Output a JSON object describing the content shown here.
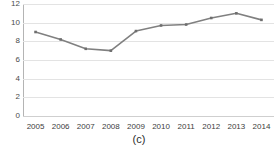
{
  "figure": {
    "caption": "(c)",
    "title_clipped": ""
  },
  "chart_data": {
    "type": "line",
    "title": "",
    "xlabel": "",
    "ylabel": "",
    "categories": [
      "2005",
      "2006",
      "2007",
      "2008",
      "2009",
      "2010",
      "2011",
      "2012",
      "2013",
      "2014"
    ],
    "values": [
      9.0,
      8.2,
      7.2,
      7.0,
      9.1,
      9.7,
      9.8,
      10.5,
      11.0,
      10.3
    ],
    "series": [
      {
        "name": "series-1",
        "values": [
          9.0,
          8.2,
          7.2,
          7.0,
          9.1,
          9.7,
          9.8,
          10.5,
          11.0,
          10.3
        ],
        "color": "#808080",
        "marker": "square"
      }
    ],
    "ylim": [
      0,
      12
    ],
    "yticks": [
      0,
      2,
      4,
      6,
      8,
      10,
      12
    ],
    "ytick_labels": [
      "0",
      "2",
      "4",
      "6",
      "8",
      "10",
      "12"
    ],
    "xtick_labels": [
      "2005",
      "2006",
      "2007",
      "2008",
      "2009",
      "2010",
      "2011",
      "2012",
      "2013",
      "2014"
    ],
    "grid": true,
    "grid_axis": "y",
    "grid_color": "#e3e3e3",
    "legend": false,
    "legend_position": "none",
    "line_color": "#808080",
    "line_width": 1.6,
    "marker_color": "#6e6e6e",
    "background": "#ffffff"
  }
}
